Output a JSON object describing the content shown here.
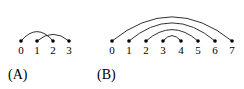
{
  "figure": {
    "background_color": "#ffffff",
    "stroke_color": "#1a1a1a",
    "node_color": "#000000",
    "width": 244,
    "height": 89
  },
  "chart_data": {
    "type": "diagram",
    "diagram_type": "arc-diagram",
    "title": "",
    "panels": [
      {
        "id": "A",
        "caption": "(A)",
        "caption_x": 8,
        "caption_y": 68,
        "description": "crossing arcs",
        "baseline_y": 41,
        "node_start_x": 21,
        "node_spacing": 16,
        "node_radius": 1.8,
        "label_y": 45,
        "nodes": [
          {
            "index": 0,
            "label": "0",
            "x": 21
          },
          {
            "index": 1,
            "label": "1",
            "x": 37
          },
          {
            "index": 2,
            "label": "2",
            "x": 53
          },
          {
            "index": 3,
            "label": "3",
            "x": 69
          }
        ],
        "arcs": [
          {
            "from": 0,
            "to": 2,
            "from_x": 21,
            "to_x": 53,
            "peak_y": 27
          },
          {
            "from": 1,
            "to": 3,
            "from_x": 37,
            "to_x": 69,
            "peak_y": 31
          }
        ]
      },
      {
        "id": "B",
        "caption": "(B)",
        "caption_x": 97,
        "caption_y": 68,
        "description": "nested arcs",
        "baseline_y": 41,
        "node_start_x": 112,
        "node_spacing": 17.2,
        "node_radius": 1.8,
        "label_y": 45,
        "nodes": [
          {
            "index": 0,
            "label": "0",
            "x": 112
          },
          {
            "index": 1,
            "label": "1",
            "x": 129
          },
          {
            "index": 2,
            "label": "2",
            "x": 146
          },
          {
            "index": 3,
            "label": "3",
            "x": 163
          },
          {
            "index": 4,
            "label": "4",
            "x": 181
          },
          {
            "index": 5,
            "label": "5",
            "x": 198
          },
          {
            "index": 6,
            "label": "6",
            "x": 215
          },
          {
            "index": 7,
            "label": "7",
            "x": 232
          }
        ],
        "arcs": [
          {
            "from": 0,
            "to": 7,
            "from_x": 112,
            "to_x": 232,
            "peak_y": 5
          },
          {
            "from": 1,
            "to": 6,
            "from_x": 129,
            "to_x": 215,
            "peak_y": 14
          },
          {
            "from": 2,
            "to": 5,
            "from_x": 146,
            "to_x": 198,
            "peak_y": 24
          },
          {
            "from": 3,
            "to": 4,
            "from_x": 163,
            "to_x": 181,
            "peak_y": 33
          }
        ]
      }
    ]
  }
}
